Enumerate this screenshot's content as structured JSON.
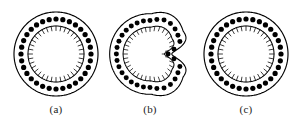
{
  "figure": {
    "background_color": "#ffffff",
    "line_color": "#000000",
    "dot_color": "#000000",
    "panels": [
      {
        "id": "a",
        "caption": "(a)",
        "shape": "circle",
        "outer_radius": 42,
        "dot_ring_radius": 35,
        "inner_radius": 28,
        "dot_count": 32,
        "dot_radius": 2.6,
        "tick_count": 36,
        "tick_length": 4.5
      },
      {
        "id": "b",
        "caption": "(b)",
        "shape": "kidney",
        "outer_radius": 42,
        "dot_ring_radius": 35,
        "inner_radius": 28,
        "dot_count": 32,
        "dot_radius": 2.6,
        "tick_count": 36,
        "tick_length": 4.5,
        "notch_depth": 0.46,
        "notch_angle_deg": 0,
        "notch_width_deg": 70
      },
      {
        "id": "c",
        "caption": "(c)",
        "shape": "circle",
        "outer_radius": 42,
        "dot_ring_radius": 35,
        "inner_radius": 28,
        "dot_count": 32,
        "dot_radius": 2.6,
        "tick_count": 36,
        "tick_length": 4.5
      }
    ]
  }
}
